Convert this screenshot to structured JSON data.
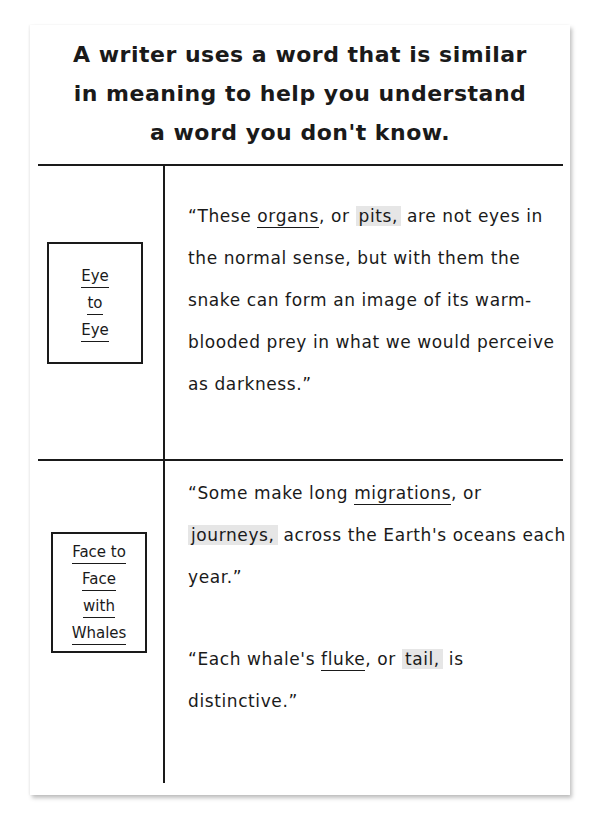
{
  "title": {
    "line1": "A writer uses a word that is similar",
    "line2": "in meaning to help you understand",
    "line3": "a word you don't know."
  },
  "rows": [
    {
      "book": {
        "lines": [
          "Eye",
          "to",
          "Eye"
        ]
      },
      "passages": [
        {
          "parts": [
            {
              "text": "“These ",
              "style": "plain"
            },
            {
              "text": "organs",
              "style": "underline"
            },
            {
              "text": ", or ",
              "style": "plain"
            },
            {
              "text": "pits,",
              "style": "highlight"
            },
            {
              "text": " are not eyes in the normal sense, but with them the snake can form an image of its warm-blooded prey in what we would perceive as darkness.”",
              "style": "plain"
            }
          ]
        }
      ]
    },
    {
      "book": {
        "lines": [
          "Face to",
          "Face",
          "with",
          "Whales"
        ]
      },
      "passages": [
        {
          "parts": [
            {
              "text": "“Some make long ",
              "style": "plain"
            },
            {
              "text": "migrations",
              "style": "underline"
            },
            {
              "text": ", or ",
              "style": "plain"
            },
            {
              "text": "journeys,",
              "style": "highlight"
            },
            {
              "text": " across the Earth's oceans each year.”",
              "style": "plain"
            }
          ]
        },
        {
          "parts": [
            {
              "text": "“Each whale's ",
              "style": "plain"
            },
            {
              "text": "fluke",
              "style": "underline"
            },
            {
              "text": ", or ",
              "style": "plain"
            },
            {
              "text": "tail,",
              "style": "highlight"
            },
            {
              "text": " is distinctive.”",
              "style": "plain"
            }
          ]
        }
      ]
    }
  ],
  "colors": {
    "ink": "#1a1a1a",
    "highlight": "#e6e6e6",
    "paper": "#ffffff"
  }
}
